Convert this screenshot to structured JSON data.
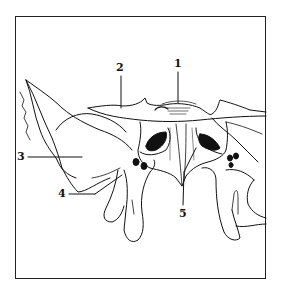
{
  "figure": {
    "stroke_color": "#111111",
    "background": "#ffffff",
    "labels": [
      {
        "id": "1",
        "text": "1",
        "x": 177,
        "y": 58
      },
      {
        "id": "2",
        "text": "2",
        "x": 116,
        "y": 62
      },
      {
        "id": "3",
        "text": "3",
        "x": 17,
        "y": 151
      },
      {
        "id": "4",
        "text": "4",
        "x": 58,
        "y": 188
      },
      {
        "id": "5",
        "text": "5",
        "x": 179,
        "y": 208
      }
    ]
  }
}
